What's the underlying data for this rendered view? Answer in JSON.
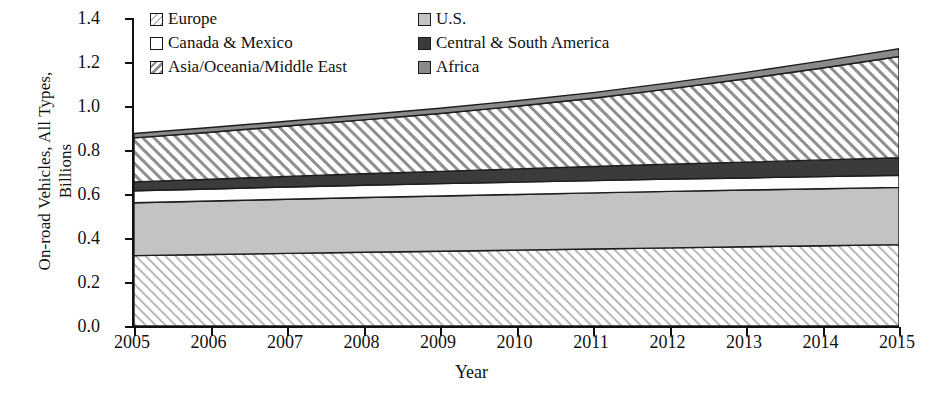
{
  "chart_data": {
    "type": "area",
    "title": "",
    "xlabel": "Year",
    "ylabel": "On-road Vehicles, All Types, Billions",
    "ylabel_line1": "On-road Vehicles, All Types,",
    "ylabel_line2": "Billions",
    "stacked": true,
    "grid": false,
    "legend_position": "top-inside",
    "ylim": [
      0.0,
      1.4
    ],
    "xlim": [
      2005,
      2015
    ],
    "ytick_labels": [
      "1.4",
      "1.2",
      "1.0",
      "0.8",
      "0.6",
      "0.4",
      "0.2",
      "0.0"
    ],
    "ytick_values": [
      1.4,
      1.2,
      1.0,
      0.8,
      0.6,
      0.4,
      0.2,
      0.0
    ],
    "categories": [
      2005,
      2006,
      2007,
      2008,
      2009,
      2010,
      2011,
      2012,
      2013,
      2014,
      2015
    ],
    "xtick_labels": [
      "2005",
      "2006",
      "2007",
      "2008",
      "2009",
      "2010",
      "2011",
      "2012",
      "2013",
      "2014",
      "2015"
    ],
    "series": [
      {
        "name": "Europe",
        "fill": "hatch-light",
        "color": "#ffffff",
        "hatch_color": "#b4b4b4",
        "values": [
          0.32,
          0.325,
          0.33,
          0.335,
          0.34,
          0.345,
          0.35,
          0.355,
          0.36,
          0.365,
          0.37
        ]
      },
      {
        "name": "U.S.",
        "fill": "solid",
        "color": "#c3c3c3",
        "hatch_color": "",
        "values": [
          0.24,
          0.243,
          0.246,
          0.249,
          0.251,
          0.253,
          0.255,
          0.257,
          0.258,
          0.259,
          0.26
        ]
      },
      {
        "name": "Canada & Mexico",
        "fill": "solid",
        "color": "#ffffff",
        "hatch_color": "",
        "values": [
          0.055,
          0.055,
          0.056,
          0.056,
          0.056,
          0.056,
          0.056,
          0.056,
          0.055,
          0.055,
          0.055
        ]
      },
      {
        "name": "Central & South America",
        "fill": "solid",
        "color": "#3b3b3b",
        "hatch_color": "",
        "values": [
          0.04,
          0.044,
          0.048,
          0.052,
          0.056,
          0.06,
          0.064,
          0.068,
          0.072,
          0.076,
          0.08
        ]
      },
      {
        "name": "Asia/Oceania/Middle East",
        "fill": "hatch-bold",
        "color": "#ffffff",
        "hatch_color": "#8c8c8c",
        "values": [
          0.2,
          0.214,
          0.229,
          0.245,
          0.263,
          0.285,
          0.31,
          0.342,
          0.379,
          0.418,
          0.46
        ]
      },
      {
        "name": "Africa",
        "fill": "solid",
        "color": "#8a8a8a",
        "hatch_color": "",
        "values": [
          0.02,
          0.021,
          0.022,
          0.023,
          0.024,
          0.025,
          0.026,
          0.027,
          0.029,
          0.032,
          0.035
        ]
      }
    ],
    "cumulative_tops": {
      "Europe": [
        0.32,
        0.325,
        0.33,
        0.335,
        0.34,
        0.345,
        0.35,
        0.355,
        0.36,
        0.365,
        0.37
      ],
      "U.S.": [
        0.56,
        0.568,
        0.576,
        0.584,
        0.591,
        0.598,
        0.605,
        0.612,
        0.618,
        0.624,
        0.63
      ],
      "Canada & Mexico": [
        0.615,
        0.623,
        0.632,
        0.64,
        0.647,
        0.654,
        0.661,
        0.668,
        0.673,
        0.679,
        0.685
      ],
      "Central & South America": [
        0.655,
        0.667,
        0.68,
        0.692,
        0.703,
        0.714,
        0.725,
        0.736,
        0.745,
        0.755,
        0.765
      ],
      "Asia/Oceania/Middle East": [
        0.855,
        0.881,
        0.909,
        0.937,
        0.966,
        0.999,
        1.035,
        1.078,
        1.124,
        1.173,
        1.225
      ],
      "Africa": [
        0.875,
        0.902,
        0.931,
        0.96,
        0.99,
        1.024,
        1.061,
        1.105,
        1.153,
        1.205,
        1.26
      ]
    }
  },
  "legend": {
    "left_column": [
      {
        "label": "Europe",
        "fill": "hatch-light"
      },
      {
        "label": "Canada & Mexico",
        "fill": "solid-white"
      },
      {
        "label": "Asia/Oceania/Middle East",
        "fill": "hatch-bold"
      }
    ],
    "right_column": [
      {
        "label": "U.S.",
        "fill": "solid-lightgray"
      },
      {
        "label": "Central & South America",
        "fill": "solid-darkgray"
      },
      {
        "label": "Africa",
        "fill": "solid-midgray"
      }
    ]
  },
  "colors": {
    "axis": "#111111",
    "europe": "#ffffff",
    "us": "#c3c3c3",
    "canada_mexico": "#ffffff",
    "central_south_america": "#3b3b3b",
    "asia_oceania_middle_east": "#ffffff",
    "africa": "#8a8a8a"
  }
}
